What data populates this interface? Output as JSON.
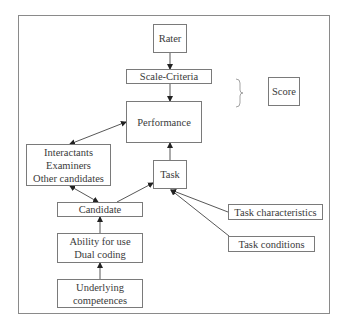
{
  "diagram": {
    "nodes": {
      "rater": {
        "lines": [
          "Rater"
        ]
      },
      "scale_criteria": {
        "lines": [
          "Scale-Criteria"
        ]
      },
      "score": {
        "lines": [
          "Score"
        ]
      },
      "performance": {
        "lines": [
          "Performance"
        ]
      },
      "interlocutors": {
        "lines": [
          "Interactants",
          "Examiners",
          "Other candidates"
        ]
      },
      "task": {
        "lines": [
          "Task"
        ]
      },
      "candidate": {
        "lines": [
          "Candidate"
        ]
      },
      "task_characteristics": {
        "lines": [
          "Task characteristics"
        ]
      },
      "task_conditions": {
        "lines": [
          "Task conditions"
        ]
      },
      "ability": {
        "lines": [
          "Ability for use",
          "Dual coding"
        ]
      },
      "competences": {
        "lines": [
          "Underlying",
          "competences"
        ]
      }
    },
    "edges": [
      {
        "from": "rater",
        "to": "scale_criteria",
        "type": "arrow"
      },
      {
        "from": "scale_criteria",
        "to": "performance",
        "type": "arrow"
      },
      {
        "from": "interlocutors",
        "to": "performance",
        "type": "double-arrow"
      },
      {
        "from": "interlocutors",
        "to": "candidate",
        "type": "double-arrow"
      },
      {
        "from": "candidate",
        "to": "task",
        "type": "arrow"
      },
      {
        "from": "task",
        "to": "performance",
        "type": "arrow"
      },
      {
        "from": "task_characteristics",
        "to": "task",
        "type": "arrow"
      },
      {
        "from": "task_conditions",
        "to": "task",
        "type": "arrow"
      },
      {
        "from": "ability",
        "to": "candidate",
        "type": "arrow"
      },
      {
        "from": "competences",
        "to": "ability",
        "type": "arrow"
      }
    ],
    "brace": {
      "spans": [
        "scale_criteria",
        "performance"
      ],
      "points_to": "score",
      "symbol": "}"
    }
  }
}
